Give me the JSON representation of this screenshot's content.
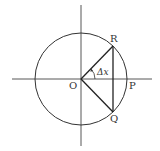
{
  "diagram": {
    "type": "unit-circle-geometry",
    "labels": {
      "origin": "O",
      "point_p": "P",
      "point_r": "R",
      "point_q": "Q",
      "angle": "Δx"
    },
    "colors": {
      "stroke": "#333333",
      "background": "#ffffff"
    },
    "geometry": {
      "center": [
        81,
        79
      ],
      "radius": 46,
      "point_r": [
        113,
        46
      ],
      "point_q": [
        113,
        112
      ],
      "point_p_on_axis": [
        127,
        79
      ]
    }
  }
}
